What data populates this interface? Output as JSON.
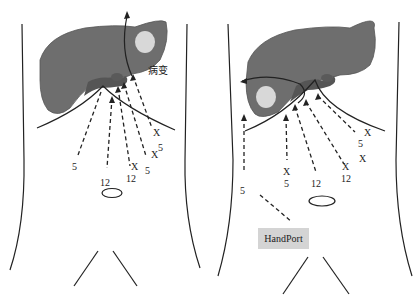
{
  "figure": {
    "panels": [
      {
        "id": "left",
        "lesion_label": "病变",
        "port_labels": {
          "a": "5",
          "b": "12",
          "c": "X",
          "d": "12",
          "e": "5",
          "f": "X",
          "g": "5",
          "h": "X",
          "i": "5"
        }
      },
      {
        "id": "right",
        "handport_label": "HandPort",
        "port_labels": {
          "a": "5",
          "b": "X",
          "c": "5",
          "d": "12",
          "e": "X",
          "f": "12",
          "g": "X",
          "h": "5",
          "i": "X"
        }
      }
    ],
    "colors": {
      "liver": "#6e6e6e",
      "liver_dark": "#505050",
      "lesion": "#d8d8d8",
      "handport_bg": "#d4d4d4",
      "line": "#222222"
    }
  }
}
